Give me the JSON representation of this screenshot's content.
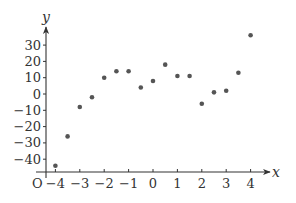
{
  "chart_data": {
    "type": "scatter",
    "title": "",
    "xlabel": "x",
    "ylabel": "y",
    "origin_label": "O",
    "xlim": [
      -4.4,
      4.7
    ],
    "ylim": [
      -48,
      40
    ],
    "grid": false,
    "legend": null,
    "x_ticks": [
      -4,
      -3,
      -2,
      -1,
      0,
      1,
      2,
      3,
      4
    ],
    "x_tick_labels": [
      "−4",
      "−3",
      "−2",
      "−1",
      "0",
      "1",
      "2",
      "3",
      "4"
    ],
    "y_ticks": [
      30,
      20,
      10,
      0,
      -10,
      -20,
      -30,
      -40
    ],
    "y_tick_labels": [
      "30",
      "20",
      "10",
      "0",
      "−10",
      "−20",
      "−30",
      "−40"
    ],
    "series": [
      {
        "name": "points",
        "x": [
          -4,
          -3.5,
          -3,
          -2.5,
          -2,
          -1.5,
          -1,
          -0.5,
          0,
          0.5,
          1,
          1.5,
          2,
          2.5,
          3,
          3.5,
          4
        ],
        "y": [
          -44,
          -26,
          -8,
          -2,
          10,
          14,
          14,
          4,
          8,
          18,
          11,
          11,
          -6,
          1,
          2,
          13,
          36
        ]
      }
    ],
    "colors": {
      "axis": "#333333",
      "point": "#555555"
    }
  }
}
